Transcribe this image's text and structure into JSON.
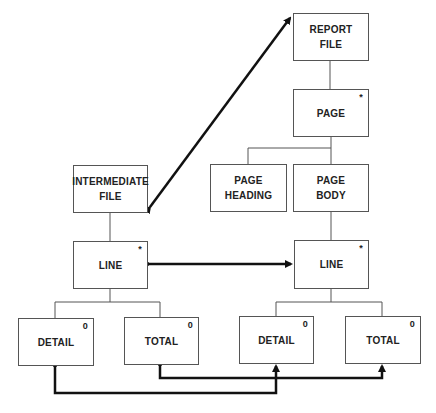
{
  "diagram": {
    "type": "Jackson structure diagram",
    "nodes": {
      "report_file": {
        "line1": "REPORT",
        "line2": "FILE",
        "mark": ""
      },
      "page": {
        "line1": "PAGE",
        "line2": "",
        "mark": "*"
      },
      "page_heading": {
        "line1": "PAGE",
        "line2": "HEADING",
        "mark": ""
      },
      "page_body": {
        "line1": "PAGE",
        "line2": "BODY",
        "mark": ""
      },
      "intermediate_file": {
        "line1": "INTERMEDIATE",
        "line2": "FILE",
        "mark": ""
      },
      "line_left": {
        "line1": "LINE",
        "line2": "",
        "mark": "*"
      },
      "line_right": {
        "line1": "LINE",
        "line2": "",
        "mark": "*"
      },
      "detail_left": {
        "line1": "DETAIL",
        "line2": "",
        "mark": "0"
      },
      "total_left": {
        "line1": "TOTAL",
        "line2": "",
        "mark": "0"
      },
      "detail_right": {
        "line1": "DETAIL",
        "line2": "",
        "mark": "0"
      },
      "total_right": {
        "line1": "TOTAL",
        "line2": "",
        "mark": "0"
      }
    },
    "edges": [
      {
        "from": "report_file",
        "to": "page",
        "kind": "hierarchy"
      },
      {
        "from": "page",
        "to": "page_heading",
        "kind": "hierarchy"
      },
      {
        "from": "page",
        "to": "page_body",
        "kind": "hierarchy"
      },
      {
        "from": "page_body",
        "to": "line_right",
        "kind": "hierarchy"
      },
      {
        "from": "intermediate_file",
        "to": "line_left",
        "kind": "hierarchy"
      },
      {
        "from": "line_left",
        "to": "detail_left",
        "kind": "hierarchy"
      },
      {
        "from": "line_left",
        "to": "total_left",
        "kind": "hierarchy"
      },
      {
        "from": "line_right",
        "to": "detail_right",
        "kind": "hierarchy"
      },
      {
        "from": "line_right",
        "to": "total_right",
        "kind": "hierarchy"
      },
      {
        "from": "intermediate_file",
        "to": "report_file",
        "kind": "correspondence"
      },
      {
        "from": "line_left",
        "to": "line_right",
        "kind": "correspondence"
      },
      {
        "from": "detail_left",
        "to": "detail_right",
        "kind": "correspondence"
      },
      {
        "from": "total_left",
        "to": "total_right",
        "kind": "correspondence"
      }
    ],
    "colors": {
      "line": "#555555",
      "arrow": "#111111",
      "text": "#222222"
    }
  }
}
